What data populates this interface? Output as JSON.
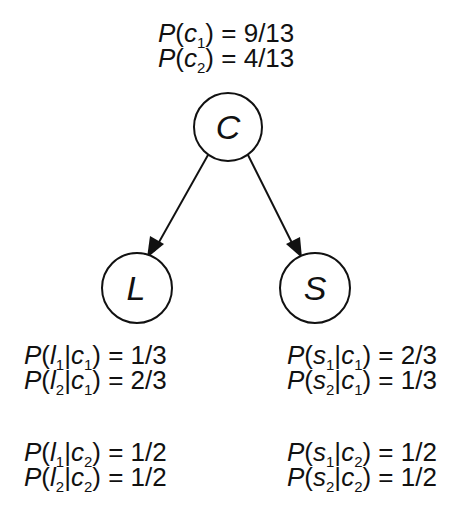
{
  "nodes": [
    {
      "id": "C",
      "label": "C",
      "cx": 228,
      "cy": 127,
      "r": 34
    },
    {
      "id": "L",
      "label": "L",
      "cx": 137,
      "cy": 288,
      "r": 35
    },
    {
      "id": "S",
      "label": "S",
      "cx": 315,
      "cy": 288,
      "r": 35
    }
  ],
  "edges": [
    {
      "from": "C",
      "to": "L"
    },
    {
      "from": "C",
      "to": "S"
    }
  ],
  "tables": {
    "C": [
      {
        "var": "c",
        "sub": "1",
        "given": "",
        "given_sub": "",
        "value": "9/13"
      },
      {
        "var": "c",
        "sub": "2",
        "given": "",
        "given_sub": "",
        "value": "4/13"
      }
    ],
    "L_c1": [
      {
        "var": "l",
        "sub": "1",
        "given": "c",
        "given_sub": "1",
        "value": "1/3"
      },
      {
        "var": "l",
        "sub": "2",
        "given": "c",
        "given_sub": "1",
        "value": "2/3"
      }
    ],
    "L_c2": [
      {
        "var": "l",
        "sub": "1",
        "given": "c",
        "given_sub": "2",
        "value": "1/2"
      },
      {
        "var": "l",
        "sub": "2",
        "given": "c",
        "given_sub": "2",
        "value": "1/2"
      }
    ],
    "S_c1": [
      {
        "var": "s",
        "sub": "1",
        "given": "c",
        "given_sub": "1",
        "value": "2/3"
      },
      {
        "var": "s",
        "sub": "2",
        "given": "c",
        "given_sub": "1",
        "value": "1/3"
      }
    ],
    "S_c2": [
      {
        "var": "s",
        "sub": "1",
        "given": "c",
        "given_sub": "2",
        "value": "1/2"
      },
      {
        "var": "s",
        "sub": "2",
        "given": "c",
        "given_sub": "2",
        "value": "1/2"
      }
    ]
  },
  "symbols": {
    "P": "P",
    "open": "(",
    "close": ")",
    "bar": "|",
    "eq": " = "
  }
}
